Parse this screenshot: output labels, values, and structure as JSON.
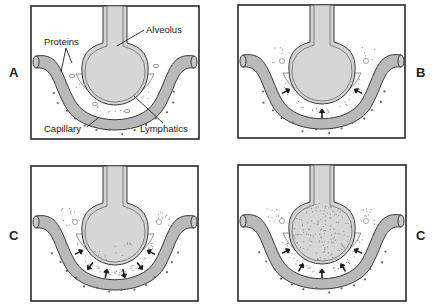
{
  "figure": {
    "panels": [
      {
        "id": "A",
        "label": "A",
        "label_side": "left",
        "stage": "normal",
        "callouts": {
          "alveolus": "Alveolus",
          "proteins": "Proteins",
          "capillary": "Capillary",
          "lymphatics": "Lymphatics"
        },
        "arrows": 0,
        "interstitial_fluid": "minimal",
        "alveolar_fluid": "none"
      },
      {
        "id": "B",
        "label": "B",
        "label_side": "right",
        "stage": "interstitial edema",
        "arrows": 3,
        "interstitial_fluid": "moderate",
        "alveolar_fluid": "none"
      },
      {
        "id": "C1",
        "label": "C",
        "label_side": "left",
        "stage": "early alveolar flooding",
        "arrows": 6,
        "interstitial_fluid": "heavy",
        "alveolar_fluid": "partial"
      },
      {
        "id": "C2",
        "label": "C",
        "label_side": "right",
        "stage": "alveolar flooding",
        "arrows": 5,
        "interstitial_fluid": "heavy",
        "alveolar_fluid": "full"
      }
    ]
  },
  "colors": {
    "frame": "#2a2a2a",
    "capillary": "#b9b9b9",
    "alveolus": "#d2d2d2",
    "interstitium": "#f4f4f4",
    "arrow": "#1a1a1a"
  }
}
